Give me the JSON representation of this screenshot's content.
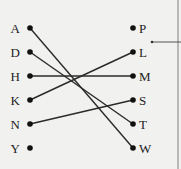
{
  "diagram": {
    "type": "matching",
    "left_items": [
      {
        "label": "A",
        "x": 30,
        "y": 28
      },
      {
        "label": "D",
        "x": 30,
        "y": 52
      },
      {
        "label": "H",
        "x": 30,
        "y": 76
      },
      {
        "label": "K",
        "x": 30,
        "y": 100
      },
      {
        "label": "N",
        "x": 30,
        "y": 124
      },
      {
        "label": "Y",
        "x": 30,
        "y": 148
      }
    ],
    "right_items": [
      {
        "label": "P",
        "x": 133,
        "y": 28
      },
      {
        "label": "L",
        "x": 133,
        "y": 52
      },
      {
        "label": "M",
        "x": 133,
        "y": 76
      },
      {
        "label": "S",
        "x": 133,
        "y": 100
      },
      {
        "label": "T",
        "x": 133,
        "y": 124
      },
      {
        "label": "W",
        "x": 133,
        "y": 148
      }
    ],
    "connections": [
      {
        "from": "A",
        "to": "W"
      },
      {
        "from": "D",
        "to": "T"
      },
      {
        "from": "H",
        "to": "M"
      },
      {
        "from": "K",
        "to": "L"
      },
      {
        "from": "N",
        "to": "S"
      }
    ],
    "callout": {
      "x1": 152,
      "y1": 42,
      "x2": 181,
      "y2": 42
    },
    "colors": {
      "line": "#2a2a2a",
      "dot": "#111111",
      "text": "#222222",
      "border": "#b8b8b6",
      "background": "#f1f1ef"
    }
  }
}
